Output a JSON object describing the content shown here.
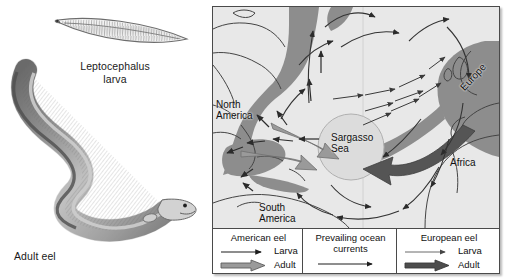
{
  "figure": {
    "larva_label": "Leptocephalus\nlarva",
    "adult_label": "Adult eel"
  },
  "map": {
    "labels": {
      "north_america": "North\nAmerica",
      "south_america": "South\nAmerica",
      "sargasso_sea": "Sargasso\nSea",
      "africa": "Africa",
      "europe": "Europe"
    },
    "colors": {
      "ocean": "#e8e8e8",
      "land": "#f0f0f0",
      "range_band": "#8d8d8d",
      "sargasso_fill": "#dcdcdc",
      "coastline": "#444444",
      "frame": "#4a4a4a",
      "american_adult_arrow": "#9a9a9a",
      "european_adult_arrow": "#555555",
      "current_arrow": "#333333"
    }
  },
  "legend": {
    "columns": [
      {
        "title": "American eel",
        "rows": [
          {
            "glyph": "thin-arrow-icon",
            "label": "Larva"
          },
          {
            "glyph": "thick-light-arrow-icon",
            "label": "Adult"
          }
        ]
      },
      {
        "title": "Prevailing ocean\ncurrents",
        "rows": [
          {
            "glyph": "thin-arrow-icon",
            "label": ""
          }
        ]
      },
      {
        "title": "European eel",
        "rows": [
          {
            "glyph": "thin-arrow-icon",
            "label": "Larva"
          },
          {
            "glyph": "thick-dark-arrow-icon",
            "label": "Adult"
          }
        ]
      }
    ]
  }
}
